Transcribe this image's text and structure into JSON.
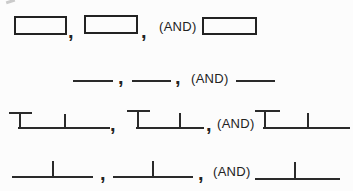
{
  "figure": {
    "type": "notation-diagram",
    "background_color": "#fcfcfc",
    "ink_color": "#2a2a2a",
    "comma": ",",
    "and_label": "(AND)",
    "rows": [
      {
        "shape": "rectangle-slot",
        "count": 3,
        "reading": "slot , slot , (AND) slot"
      },
      {
        "shape": "blank-line",
        "count": 3,
        "reading": "line , line , (AND) line"
      },
      {
        "shape": "tee-capped-line-with-mid-tick",
        "count": 3,
        "reading": "tee , tee , (AND) tee"
      },
      {
        "shape": "line-with-mid-tick",
        "count": 3,
        "reading": "line , line , (AND) line"
      }
    ]
  }
}
